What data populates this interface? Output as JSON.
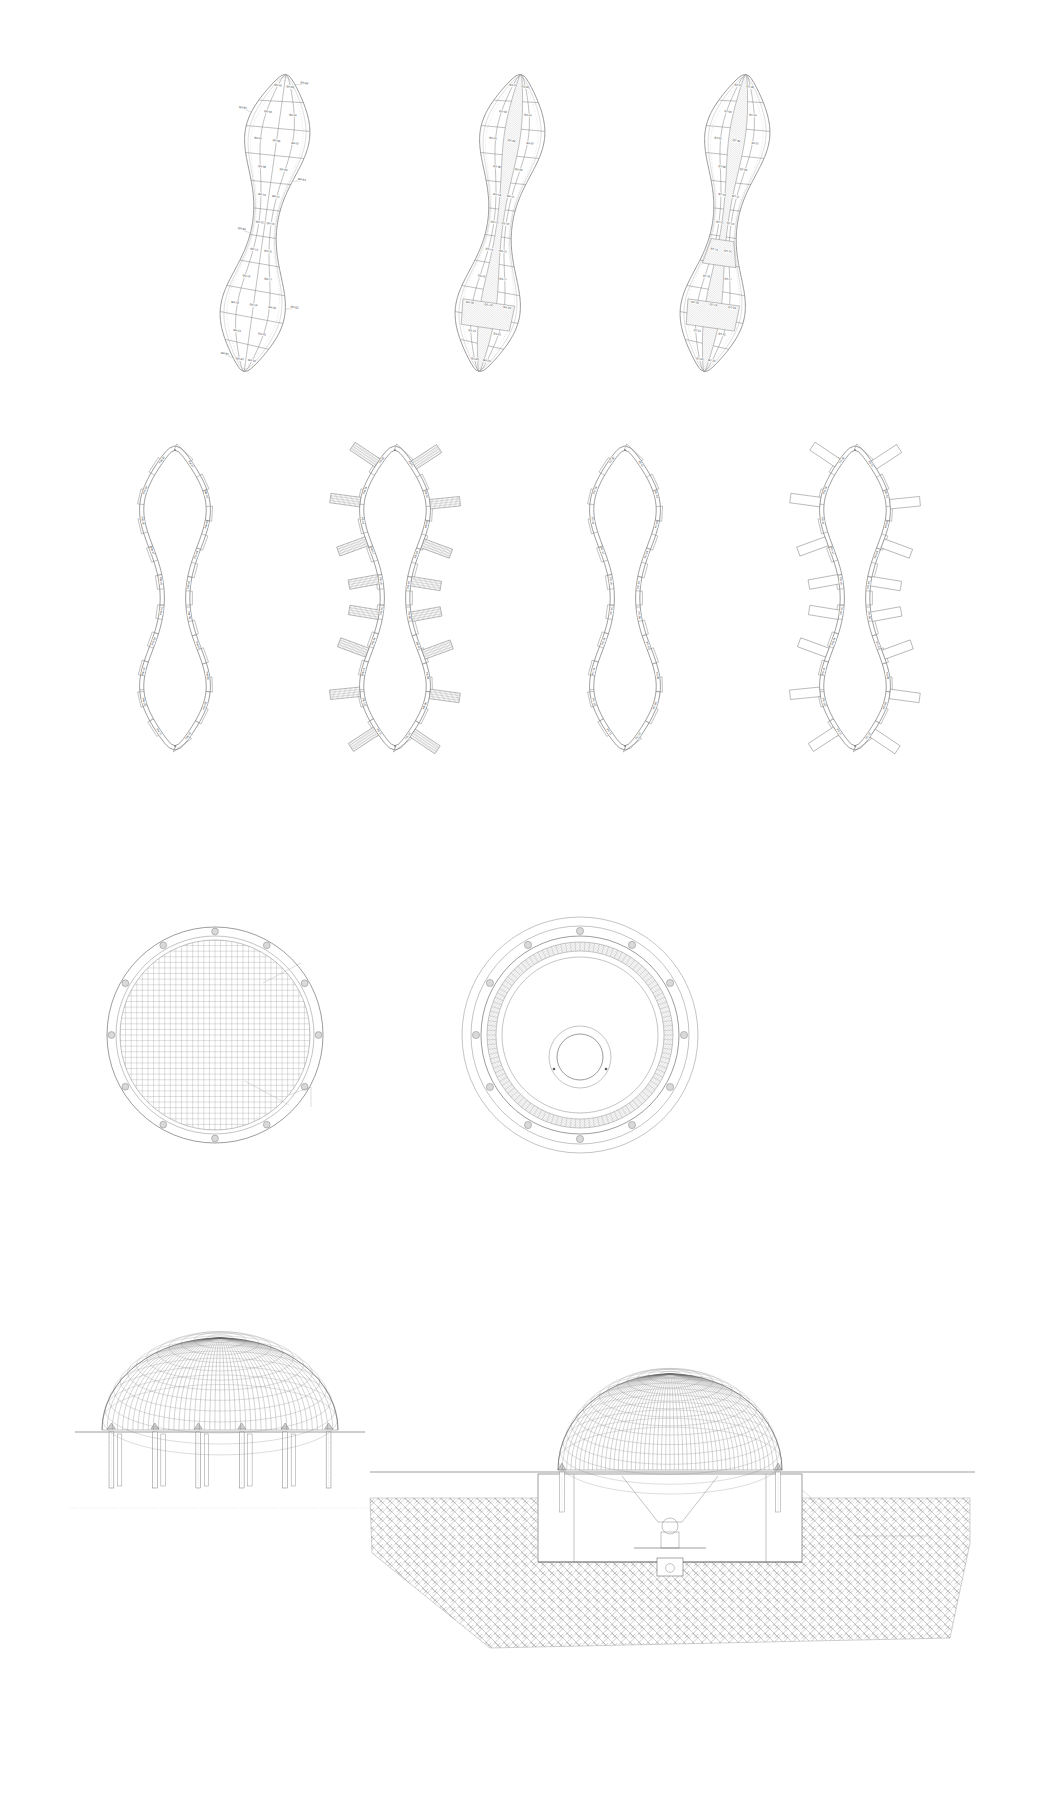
{
  "sheet": {
    "title": "Structural Layout And Section Drawing Sheet",
    "background_color": "#ffffff",
    "line_color": "#5a5a5a",
    "hatch_color": "#8b8b8b",
    "node_fill": "#d9d9d9",
    "width_px": 1056,
    "height_px": 1795
  },
  "rows": [
    {
      "name": "row-1-panelised-plans",
      "description": "Three peanut / figure-eight shaped panelised roof plans with numbered panel grid"
    },
    {
      "name": "row-2-perimeter-plans",
      "description": "Four figure-eight perimeter wall plans, two with radial buttress fins"
    },
    {
      "name": "row-3-circular-plans",
      "description": "Two circular dome plans, one gridded mesh and one ringed with central oculus"
    },
    {
      "name": "row-4-sections",
      "description": "Two dome elevations/sections, one on piles and one over a buried basement"
    }
  ],
  "figure_1": {
    "name": "panelised-plan-plain",
    "caption": "",
    "panel_labels": [
      "GR-01",
      "GR-02",
      "GR-03",
      "GR-04",
      "GR-05",
      "GR-06",
      "GR-07",
      "GR-08",
      "GR-09",
      "GR-10",
      "GR-11",
      "GR-12",
      "GR-13",
      "GR-14",
      "GR-15",
      "GR-16",
      "GR-17",
      "GR-18",
      "GR-19",
      "GR-20",
      "GR-21",
      "GR-22",
      "GR-23",
      "GR-24",
      "GR-25",
      "GR-26",
      "GR-27",
      "GR-28",
      "GR-29",
      "GR-30"
    ],
    "edge_labels": [
      "GR-E1",
      "GR-E2",
      "GR-E3",
      "GR-E4",
      "GR-E5",
      "GR-E6",
      "GR-E7",
      "GR-E8"
    ],
    "shaded": false
  },
  "figure_2": {
    "name": "panelised-plan-shaded-spine",
    "caption": "",
    "panel_labels": [
      "GS-01",
      "GS-02",
      "GS-03",
      "GS-04",
      "GS-05",
      "GS-06",
      "GS-07",
      "GS-08",
      "GS-09",
      "GS-10",
      "GS-11",
      "GS-12",
      "GS-13",
      "GS-14",
      "GS-15",
      "GS-16",
      "GS-17",
      "GS-18",
      "GS-19",
      "GS-20",
      "GS-21",
      "GS-22",
      "GS-23",
      "GS-24",
      "GS-25",
      "GS-26",
      "GS-27",
      "GS-28"
    ],
    "shaded": true,
    "shade_pattern": "diagonal-hatch",
    "shaded_description": "Central spine column plus cross-arm panels hatched"
  },
  "figure_3": {
    "name": "panelised-plan-shaded-spine-alt",
    "caption": "",
    "panel_labels": [
      "GT-01",
      "GT-02",
      "GT-03",
      "GT-04",
      "GT-05",
      "GT-06",
      "GT-07",
      "GT-08",
      "GT-09",
      "GT-10",
      "GT-11",
      "GT-12",
      "GT-13",
      "GT-14",
      "GT-15",
      "GT-16",
      "GT-17",
      "GT-18",
      "GT-19",
      "GT-20",
      "GT-21",
      "GT-22",
      "GT-23",
      "GT-24",
      "GT-25",
      "GT-26",
      "GT-27",
      "GT-28"
    ],
    "shaded": true,
    "shade_pattern": "diagonal-hatch",
    "shaded_description": "Continuous shaded spine with upper cross-arm"
  },
  "figure_4": {
    "name": "perimeter-plan-plain-left",
    "segment_labels": [
      "PW-01",
      "PW-02",
      "PW-03",
      "PW-04",
      "PW-05",
      "PW-06",
      "PW-07",
      "PW-08",
      "PW-09",
      "PW-10",
      "PW-11",
      "PW-12",
      "PW-13",
      "PW-14",
      "PW-15",
      "PW-16",
      "PW-17",
      "PW-18",
      "PW-19",
      "PW-20"
    ],
    "fins": false
  },
  "figure_5": {
    "name": "perimeter-plan-hatched-fins",
    "segment_labels": [
      "PB-01",
      "PB-02",
      "PB-03",
      "PB-04",
      "PB-05",
      "PB-06",
      "PB-07",
      "PB-08",
      "PB-09",
      "PB-10",
      "PB-11",
      "PB-12",
      "PB-13",
      "PB-14",
      "PB-15",
      "PB-16",
      "PB-17",
      "PB-18",
      "PB-19",
      "PB-20"
    ],
    "fins": true,
    "fin_style": "hatched",
    "fin_count": 16
  },
  "figure_6": {
    "name": "perimeter-plan-plain-right",
    "segment_labels": [
      "PC-01",
      "PC-02",
      "PC-03",
      "PC-04",
      "PC-05",
      "PC-06",
      "PC-07",
      "PC-08",
      "PC-09",
      "PC-10",
      "PC-11",
      "PC-12",
      "PC-13",
      "PC-14",
      "PC-15",
      "PC-16",
      "PC-17",
      "PC-18",
      "PC-19",
      "PC-20"
    ],
    "fins": false
  },
  "figure_7": {
    "name": "perimeter-plan-outline-fins",
    "segment_labels": [
      "PD-01",
      "PD-02",
      "PD-03",
      "PD-04",
      "PD-05",
      "PD-06",
      "PD-07",
      "PD-08",
      "PD-09",
      "PD-10",
      "PD-11",
      "PD-12",
      "PD-13",
      "PD-14",
      "PD-15",
      "PD-16",
      "PD-17",
      "PD-18",
      "PD-19",
      "PD-20"
    ],
    "fins": true,
    "fin_style": "outline",
    "fin_count": 16
  },
  "figure_8": {
    "name": "circular-plan-gridded",
    "node_count": 12,
    "grid": {
      "rows": 34,
      "cols": 34
    },
    "leader_label": "",
    "rings": 2
  },
  "figure_9": {
    "name": "circular-plan-ringed",
    "node_count": 12,
    "rings": 4,
    "hatched_band": true,
    "oculus": true
  },
  "figure_10": {
    "name": "dome-elevation-on-piles",
    "meridians": 46,
    "rings": 13,
    "columns": 6,
    "ground_line": true
  },
  "figure_11": {
    "name": "dome-section-buried-basement",
    "meridians": 52,
    "rings": 15,
    "ground_hatch": "herringbone",
    "has_hopper": true,
    "has_basement": true
  }
}
